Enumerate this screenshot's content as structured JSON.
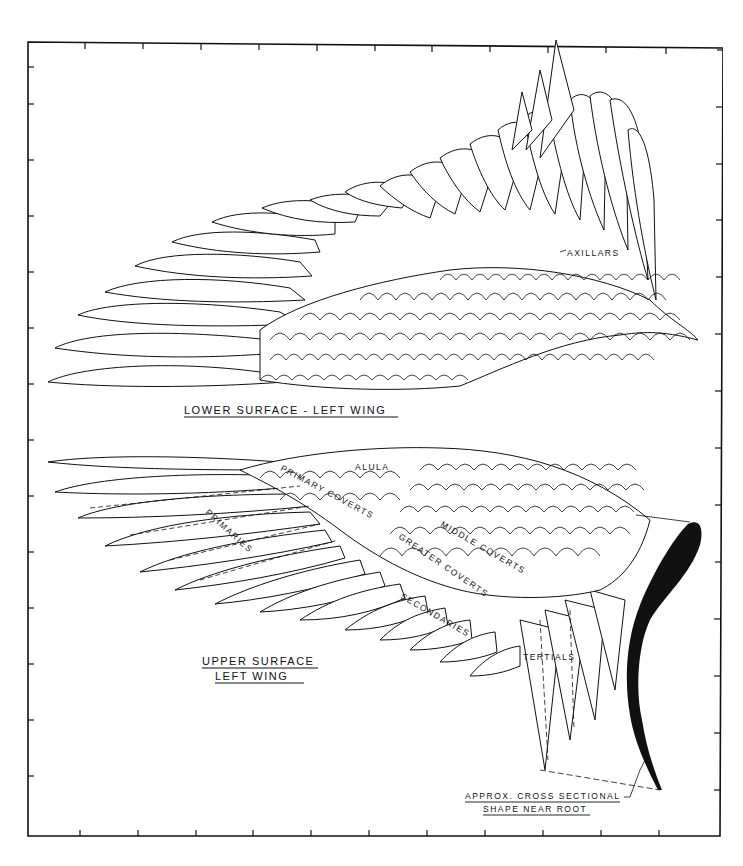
{
  "diagram": {
    "title_lower": "LOWER SURFACE - LEFT WING",
    "title_upper_line1": "UPPER SURFACE",
    "title_upper_line2": "LEFT WING",
    "cross_section_line1": "APPROX. CROSS SECTIONAL",
    "cross_section_line2": "SHAPE NEAR ROOT",
    "labels": {
      "axillars": "AXILLARS",
      "alula": "ALULA",
      "primary_coverts": "PRIMARY COVERTS",
      "primaries": "PRIMARIES",
      "middle_coverts": "MIDDLE COVERTS",
      "greater_coverts": "GREATER COVERTS",
      "secondaries": "SECONDARIES",
      "tertials": "TERTIALS"
    },
    "colors": {
      "ink": "#111111",
      "paper": "#ffffff"
    }
  },
  "footer": {
    "caption": ""
  }
}
